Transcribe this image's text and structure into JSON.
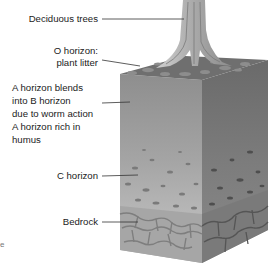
{
  "diagram": {
    "type": "soil-profile",
    "labels": {
      "trees": "Deciduous trees",
      "o_horizon_1": "O horizon:",
      "o_horizon_2": "plant litter",
      "a_horizon_1": "A horizon blends",
      "a_horizon_2": "into B horizon",
      "a_horizon_3": "due to worm action",
      "a_horizon_4": "A horizon rich in",
      "a_horizon_5": "humus",
      "c_horizon": "C horizon",
      "bedrock": "Bedrock",
      "stray_char": "e"
    },
    "colors": {
      "front_face": "#9a9a9a",
      "side_face": "#6e6e6e",
      "bedrock_front": "#a8a8a8",
      "bedrock_side": "#7a7a7a",
      "trunk": "#b5b5b5",
      "leader_line": "#333333"
    }
  }
}
